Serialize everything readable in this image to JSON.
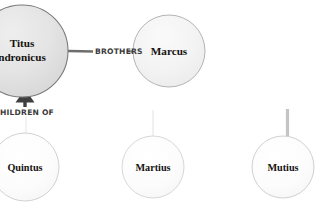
{
  "diagram": {
    "type": "relationship-graph",
    "background_color": "#ffffff",
    "nodes": [
      {
        "id": "titus",
        "label_lines": [
          "Titus",
          "ndronicus"
        ],
        "full_label": "Titus Andronicus",
        "cx": 22,
        "cy": 51,
        "r": 46,
        "fill": "#e2e2e2",
        "stroke": "#7b7b7b",
        "clipped_left": true
      },
      {
        "id": "marcus",
        "label_lines": [
          "Marcus"
        ],
        "full_label": "Marcus",
        "cx": 169,
        "cy": 51,
        "r": 36,
        "fill": "#f4f4f4",
        "stroke": "#b4b4b4",
        "clipped_left": false
      },
      {
        "id": "quintus",
        "label_lines": [
          "Quintus"
        ],
        "full_label": "Quintus",
        "cx": 25,
        "cy": 167,
        "r": 34,
        "fill": "#fbfbfb",
        "stroke": "#d2d2d2",
        "clipped_left": true
      },
      {
        "id": "martius",
        "label_lines": [
          "Martius"
        ],
        "full_label": "Martius",
        "cx": 153,
        "cy": 167,
        "r": 31,
        "fill": "#fcfcfc",
        "stroke": "#d8d8d8",
        "clipped_left": false
      },
      {
        "id": "mutius",
        "label_lines": [
          "Mutius"
        ],
        "full_label": "Mutius",
        "cx": 283,
        "cy": 167,
        "r": 31,
        "fill": "#fcfcfc",
        "stroke": "#d0d0d0",
        "clipped_left": false
      }
    ],
    "edges": [
      {
        "id": "brothers",
        "label": "BROTHERS",
        "from": "titus",
        "to": "marcus",
        "label_x": 100,
        "label_y": 54,
        "stroke": "#6e6e6e"
      },
      {
        "id": "children-of",
        "label": "HILDREN OF",
        "full_label": "CHILDREN OF",
        "from": "children",
        "to": "titus",
        "label_x": 2,
        "label_y": 115,
        "stroke": "#3f3f3f",
        "has_arrowhead": true,
        "clipped_left": true
      }
    ]
  }
}
